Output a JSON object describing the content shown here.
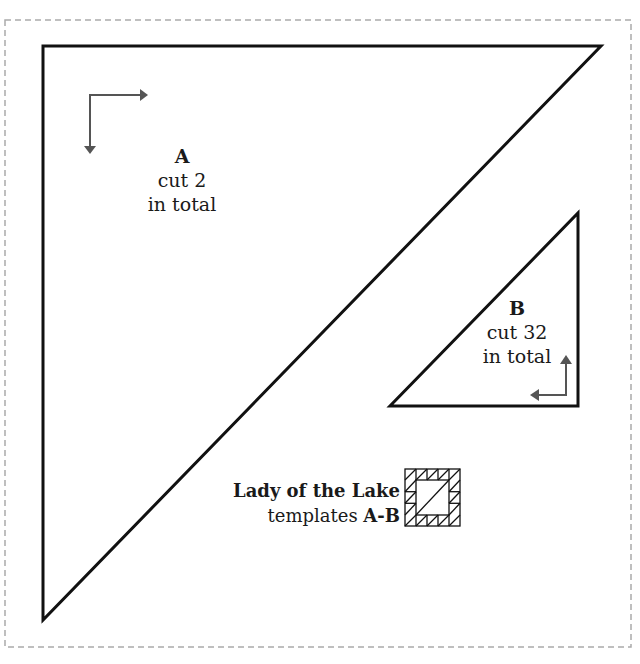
{
  "colors": {
    "outline": "#111111",
    "arrow": "#555555",
    "dashed_border": "#aaaaaa",
    "background": "#ffffff"
  },
  "pieces": [
    {
      "id": "A",
      "letter": "A",
      "instruction": "cut 2",
      "qualifier": "in total",
      "shape": "right-triangle",
      "grain_arrows": "right and down from top-left corner"
    },
    {
      "id": "B",
      "letter": "B",
      "instruction": "cut 32",
      "qualifier": "in total",
      "shape": "right-triangle",
      "grain_arrows": "up and left from bottom-right corner"
    }
  ],
  "caption": {
    "title": "Lady of the Lake",
    "subtitle_prefix": "templates ",
    "subtitle_bold": "A-B"
  },
  "block_icon": "lady-of-the-lake-quilt-block-icon"
}
